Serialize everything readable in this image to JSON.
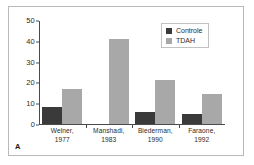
{
  "figure": {
    "panel_label": "A"
  },
  "legend": {
    "position": "top-right",
    "entries": [
      {
        "label": "Controle",
        "color": "#3a3a3a",
        "swatch_name": "legend-swatch-controle"
      },
      {
        "label": "TDAH",
        "color": "#a8a8a8",
        "swatch_name": "legend-swatch-tdah"
      }
    ]
  },
  "axis": {
    "y_ticks": [
      "0",
      "10",
      "20",
      "30",
      "40",
      "50"
    ]
  },
  "x_labels": [
    {
      "line1": "Welner,",
      "line2": "1977"
    },
    {
      "line1": "Manshadi,",
      "line2": "1983"
    },
    {
      "line1": "Biederman,",
      "line2": "1990"
    },
    {
      "line1": "Faraone,",
      "line2": "1992"
    }
  ],
  "chart_data": {
    "type": "bar",
    "title": "",
    "subtitle": "",
    "xlabel": "",
    "ylabel": "",
    "ylim": [
      0,
      50
    ],
    "yticks": [
      0,
      10,
      20,
      30,
      40,
      50
    ],
    "grid": false,
    "legend_position": "top-right",
    "categories": [
      "Welner, 1977",
      "Manshadi, 1983",
      "Biederman, 1990",
      "Faraone, 1992"
    ],
    "series": [
      {
        "name": "Controle",
        "color": "#3a3a3a",
        "values": [
          8,
          0,
          6,
          5
        ]
      },
      {
        "name": "TDAH",
        "color": "#a8a8a8",
        "values": [
          17,
          41,
          21,
          14.5
        ]
      }
    ],
    "annotations": [
      {
        "text": "A",
        "position": "bottom-left"
      }
    ]
  },
  "colors": {
    "controle": "#3a3a3a",
    "tdah": "#a8a8a8",
    "axis": "#4a4a4a",
    "frame": "#b9b9b9",
    "background": "#ffffff"
  }
}
